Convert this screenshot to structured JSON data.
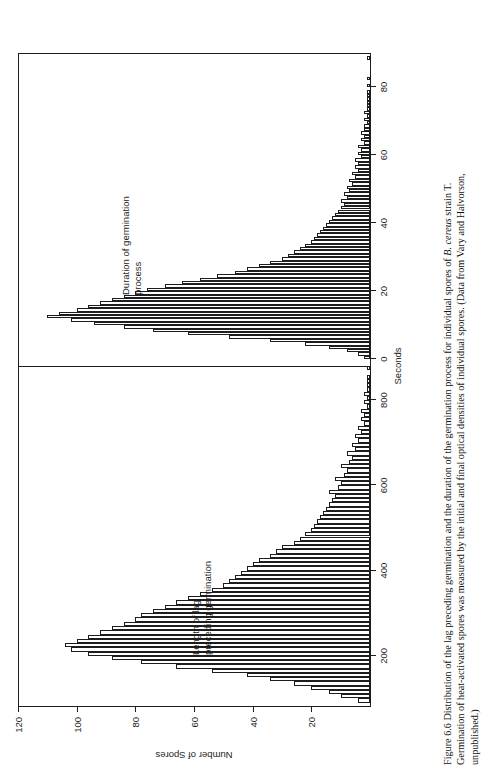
{
  "figure": {
    "caption_lines": [
      "Figure 6.6   Distribution of the lag preceding germination and the duration of the germination process for individual spores of B. cereus strain T.",
      "Germination of heat-activated spores was measured by the initial and final optical densities of individual spores. (Data from Vary and Halvorson,",
      "unpublished.)"
    ],
    "caption_number": "Figure 6.6",
    "italic_term": "B. cereus"
  },
  "chart_data": {
    "type": "bar",
    "title": "Distribution of the lag preceding germination and the duration of the germination process for individual spores of B. cereus strain T.",
    "orientation": "vertical-bars-rotated-90",
    "xlabel": "Seconds",
    "ylabel": "Number of Spores",
    "ylim": [
      0,
      120
    ],
    "yticks": [
      20,
      40,
      60,
      80,
      100,
      120
    ],
    "grid": false,
    "legend": "none",
    "panels": [
      {
        "name": "lag",
        "label": "Length of lag\npreceding germination",
        "label_line1": "Length of lag",
        "label_line2": "preceding germination",
        "xlim": [
          80,
          880
        ],
        "xticks": [
          200,
          400,
          600,
          800
        ],
        "bin_width": 10,
        "x": [
          90,
          100,
          110,
          120,
          130,
          140,
          150,
          160,
          170,
          180,
          190,
          200,
          210,
          220,
          230,
          240,
          250,
          260,
          270,
          280,
          290,
          300,
          310,
          320,
          330,
          340,
          350,
          360,
          370,
          380,
          390,
          400,
          410,
          420,
          430,
          440,
          450,
          460,
          470,
          480,
          490,
          500,
          510,
          520,
          530,
          540,
          550,
          560,
          570,
          580,
          590,
          600,
          610,
          620,
          630,
          640,
          650,
          660,
          670,
          680,
          690,
          700,
          710,
          720,
          730,
          740,
          750,
          760,
          770,
          780,
          790,
          800,
          810,
          820,
          830,
          840,
          850,
          860,
          870
        ],
        "values": [
          4,
          10,
          14,
          20,
          26,
          34,
          42,
          54,
          66,
          78,
          88,
          96,
          102,
          104,
          100,
          96,
          92,
          88,
          84,
          80,
          78,
          74,
          70,
          66,
          62,
          58,
          54,
          50,
          48,
          46,
          44,
          42,
          40,
          38,
          34,
          32,
          30,
          26,
          24,
          22,
          20,
          19,
          18,
          17,
          16,
          15,
          14,
          13,
          12,
          14,
          11,
          10,
          12,
          9,
          8,
          10,
          7,
          6,
          8,
          5,
          6,
          4,
          5,
          3,
          4,
          2,
          3,
          2,
          3,
          1,
          2,
          1,
          2,
          1,
          1,
          1,
          1,
          0,
          1
        ]
      },
      {
        "name": "duration",
        "label": "Duration of germination\nprocess",
        "label_line1": "Duration of germination",
        "label_line2": "process",
        "xlim": [
          -2,
          90
        ],
        "xticks": [
          0,
          20,
          40,
          60,
          80
        ],
        "bin_width": 1,
        "x": [
          0,
          1,
          2,
          3,
          4,
          5,
          6,
          7,
          8,
          9,
          10,
          11,
          12,
          13,
          14,
          15,
          16,
          17,
          18,
          19,
          20,
          21,
          22,
          23,
          24,
          25,
          26,
          27,
          28,
          29,
          30,
          31,
          32,
          33,
          34,
          35,
          36,
          37,
          38,
          39,
          40,
          41,
          42,
          43,
          44,
          45,
          46,
          47,
          48,
          49,
          50,
          51,
          52,
          53,
          54,
          55,
          56,
          57,
          58,
          59,
          60,
          61,
          62,
          63,
          64,
          65,
          66,
          67,
          68,
          69,
          70,
          71,
          72,
          73,
          74,
          75,
          76,
          77,
          78,
          79,
          80,
          81,
          82,
          83,
          84,
          85,
          86,
          87,
          88
        ],
        "values": [
          2,
          4,
          8,
          14,
          22,
          34,
          48,
          62,
          74,
          84,
          94,
          102,
          110,
          106,
          100,
          96,
          92,
          88,
          84,
          80,
          76,
          70,
          64,
          58,
          52,
          46,
          42,
          38,
          34,
          30,
          28,
          26,
          24,
          22,
          20,
          19,
          18,
          17,
          16,
          15,
          14,
          13,
          12,
          11,
          10,
          9,
          10,
          8,
          9,
          7,
          8,
          6,
          7,
          5,
          6,
          4,
          5,
          4,
          5,
          3,
          4,
          3,
          4,
          2,
          3,
          2,
          3,
          2,
          2,
          1,
          2,
          1,
          2,
          1,
          1,
          1,
          1,
          1,
          1,
          0,
          1,
          0,
          1,
          0,
          0,
          0,
          0,
          0,
          1
        ]
      }
    ]
  }
}
